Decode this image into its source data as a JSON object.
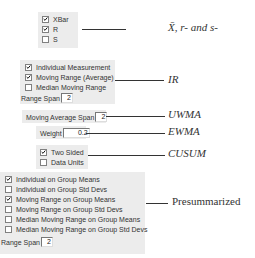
{
  "xbar_r_s": {
    "items": [
      {
        "label": "XBar",
        "checked": true
      },
      {
        "label": "R",
        "checked": true
      },
      {
        "label": "S",
        "checked": false
      }
    ],
    "annotation": "X̄, r- and s-"
  },
  "ir": {
    "items": [
      {
        "label": "Individual Measurement",
        "checked": true
      },
      {
        "label": "Moving Range (Average)",
        "checked": true
      },
      {
        "label": "Median Moving Range",
        "checked": false
      }
    ],
    "range_span_label": "Range Span",
    "range_span_value": "2",
    "annotation": "IR"
  },
  "uwma": {
    "label": "Moving Average Span",
    "value": "2",
    "annotation": "UWMA"
  },
  "ewma": {
    "label": "Weight",
    "value": "0.2",
    "annotation": "EWMA"
  },
  "cusum": {
    "items": [
      {
        "label": "Two Sided",
        "checked": true
      },
      {
        "label": "Data Units",
        "checked": false
      }
    ],
    "annotation": "CUSUM"
  },
  "presummarized": {
    "items": [
      {
        "label": "Individual on Group Means",
        "checked": true
      },
      {
        "label": "Individual on Group Std Devs",
        "checked": false
      },
      {
        "label": "Moving Range on Group Means",
        "checked": true
      },
      {
        "label": "Moving Range on Group Std Devs",
        "checked": false
      },
      {
        "label": "Median Moving Range on Group Means",
        "checked": false
      },
      {
        "label": "Median Moving Range on Group Std Devs",
        "checked": false
      }
    ],
    "range_span_label": "Range Span",
    "range_span_value": "2",
    "annotation": "Presummarized"
  }
}
